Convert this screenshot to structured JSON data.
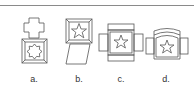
{
  "diagram": {
    "type": "spatial-reasoning folded-box options",
    "options": [
      {
        "label": "a.",
        "description": "plus-shaped flap above beveled square frame containing eight-point star outline"
      },
      {
        "label": "b.",
        "description": "beveled square frame containing five-point star with slanted parallelogram flap below"
      },
      {
        "label": "c.",
        "description": "cross-shaped net with central square containing five-point star and four side flaps"
      },
      {
        "label": "d.",
        "description": "central curved-top panel with five-point star and two side flaps"
      }
    ],
    "stroke_color": "#555555"
  }
}
